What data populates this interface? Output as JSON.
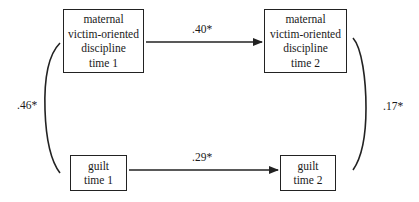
{
  "diagram": {
    "type": "cross-lagged path model",
    "nodes": {
      "discipline_t1": {
        "lines": [
          "maternal",
          "victim-oriented",
          "discipline",
          "time 1"
        ]
      },
      "discipline_t2": {
        "lines": [
          "maternal",
          "victim-oriented",
          "discipline",
          "time 2"
        ]
      },
      "guilt_t1": {
        "lines": [
          "guilt",
          "time 1"
        ]
      },
      "guilt_t2": {
        "lines": [
          "guilt",
          "time 2"
        ]
      }
    },
    "paths": [
      {
        "from": "discipline_t1",
        "to": "discipline_t2",
        "type": "arrow",
        "label": ".40*"
      },
      {
        "from": "guilt_t1",
        "to": "guilt_t2",
        "type": "arrow",
        "label": ".29*"
      },
      {
        "from": "discipline_t1",
        "to": "guilt_t1",
        "type": "correlation-curve",
        "label": ".46*"
      },
      {
        "from": "discipline_t2",
        "to": "guilt_t2",
        "type": "correlation-curve",
        "label": ".17*"
      }
    ]
  }
}
